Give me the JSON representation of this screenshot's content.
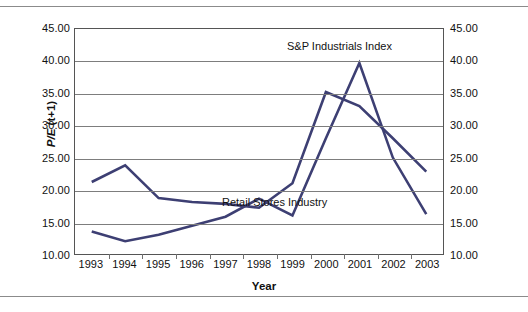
{
  "figure": {
    "axis_title_x": "Year",
    "axis_title_y_prefix": "P/E",
    "axis_title_y_suffix": " (t+1)",
    "line_color": "#3d3f73",
    "grid_color": "#7d7d7d",
    "frame_color": "#555555"
  },
  "annotations": {
    "sp": "S&P Industrials Index",
    "retail": "Retail Stores Industry"
  },
  "chart_data": {
    "type": "line",
    "title": "",
    "xlabel": "Year",
    "ylabel": "P/E (t+1)",
    "categories": [
      "1993",
      "1994",
      "1995",
      "1996",
      "1997",
      "1998",
      "1999",
      "2000",
      "2001",
      "2002",
      "2003"
    ],
    "ylim": [
      10.0,
      45.0
    ],
    "ytick_values": [
      10.0,
      15.0,
      20.0,
      25.0,
      30.0,
      35.0,
      40.0,
      45.0
    ],
    "ytick_labels_left": [
      "10.00",
      "15.00",
      "20.00",
      "25.00",
      "30.00",
      "35.00",
      "40.00",
      "45.00"
    ],
    "ytick_labels_right": [
      "10.00",
      "15.00",
      "20.00",
      "25.00",
      "30.00",
      "35.00",
      "40.00",
      "45.00"
    ],
    "grid": true,
    "legend": "inline-annotations",
    "series": [
      {
        "name": "S&P Industrials Index",
        "color": "#3d3f73",
        "values": [
          21.2,
          23.8,
          18.7,
          18.1,
          17.8,
          17.2,
          21.0,
          35.2,
          33.0,
          28.0,
          22.8
        ]
      },
      {
        "name": "Retail Stores Industry",
        "color": "#3d3f73",
        "values": [
          13.5,
          12.0,
          13.0,
          14.4,
          15.8,
          18.6,
          16.0,
          28.0,
          39.7,
          25.0,
          16.2
        ]
      }
    ]
  }
}
